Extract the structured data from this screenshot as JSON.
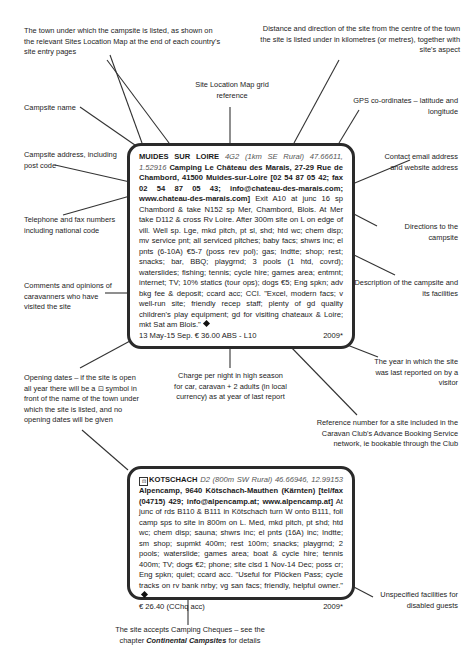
{
  "callouts": {
    "town": "The town under which the campsite is listed, as shown on the relevant Sites Location Map at the end of each country's site entry pages",
    "distance": "Distance and direction of the site from the centre of the town the site is listed under in kilometres (or metres), together with site's aspect",
    "grid_ref": "Site Location Map grid reference",
    "gps": "GPS co-ordinates – latitude and longitude",
    "name": "Campsite name",
    "address": "Campsite address, including post code",
    "contact": "Contact email address and website address",
    "phone": "Telephone and fax numbers including national code",
    "directions": "Directions to the campsite",
    "description": "Description of the campsite and its facilities",
    "comments": "Comments and opinions of caravanners who have visited the site",
    "year": "The year in which the site was last reported on by a visitor",
    "opening": "Opening dates – if the site is open all year there will be a ⊡ symbol in front of the name of the town under which the site is listed, and no opening dates will be given",
    "charge": "Charge per night in high season for car, caravan + 2 adults (in local currency) as at year of last report",
    "abs": "Reference number for a site included in the Caravan Club's Advance Booking Service network, ie bookable through the Club",
    "disabled": "Unspecified facilities for disabled guests",
    "cheques_pre": "The site accepts Camping Cheques – see the chapter",
    "cheques_italic": "Continental Campsites",
    "cheques_post": "for details"
  },
  "entry1": {
    "town": "MUIDES SUR LOIRE",
    "grid": "4G2",
    "distance": "(1km SE Rural)",
    "gps": "47.66611, 1.52916",
    "name_address": "Camping Le Château des Marais, 27-29 Rue de Chambord, 41500 Muides-sur-Loire",
    "contact": "[02 54 87 05 42; fax 02 54 87 05 43; info@chateau-des-marais.com; www.chateau-des-marais.com]",
    "directions": "Exit A10 at junc 16 sp Chambord & take N152 sp Mer, Chambord, Blois. At Mer take D112 & cross Rv Loire. After 300m site on L on edge of vill.",
    "description": "Well sp. Lge, mkd pitch, pt sl, shd; htd wc; chem disp; mv service pnt; all serviced pitches; baby facs; shwrs inc; el pnts (6-10A) €5-7 (poss rev pol); gas; Indtte; shop; rest; snacks; bar, BBQ; playgrnd; 3 pools (1 htd, covrd); waterslides; fishing; tennis; cycle hire; games area; entmnt; internet; TV; 10% statics (tour ops); dogs €5; Eng spkn; adv bkg fee & deposit; ccard acc; CCI.",
    "comment": "\"Excel, modern facs; v well-run site; friendly recep staff; plenty of gd quality children's play equipment; gd for visiting chateaux & Loire; mkt Sat am Blois.\"",
    "footer_left": "13 May-15 Sep. € 36.00  ABS - L10",
    "footer_right": "2009*"
  },
  "entry2": {
    "open_symbol": "⊡",
    "town": "KOTSCHACH",
    "grid": "D2",
    "distance": "(800m SW Rural)",
    "gps": "46.66946, 12.99153",
    "name_address": "Alpencamp, 9640 Kötschach-Mauthen (Kärnten)",
    "contact": "[tel/fax (04715) 429; info@alpencamp.at; www.alpencamp.at]",
    "directions": "At junc of rds B110 & B111 in Kötschach turn W onto B111, foll camp sps to site in 800m on L.",
    "description": "Med, mkd pitch, pt shd; htd wc; chem disp; sauna; shwrs inc; el pnts (16A) inc; Indtte; sm shop; supmkt 400m; rest 100m; snacks; playgrnd; 2 pools; waterslide; games area; boat & cycle hire; tennis 400m; TV; dogs €2; phone; site clsd 1 Nov-14 Dec; poss cr; Eng spkn; quiet; ccard acc.",
    "comment": "\"Useful for Plöcken Pass; cycle tracks on rv bank nrby; vg san facs; friendly, helpful owner.\"",
    "footer_left": "€ 26.40 (CChq acc)",
    "footer_right": "2009*"
  }
}
